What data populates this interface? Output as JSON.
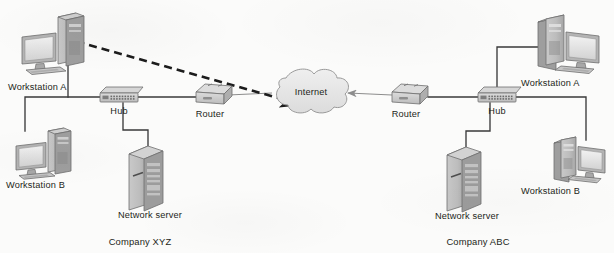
{
  "diagram": {
    "background_color": "#fbfbfa",
    "line_color": "#3a3a3a",
    "dashed_line_color": "#1c1c1c",
    "cloud_fill": "#e6e6e6",
    "cloud_stroke": "#9a9a9a",
    "device_fill": "#d9d9d9",
    "device_stroke": "#6e6e6e",
    "text_color": "#231f20"
  },
  "labels": {
    "internet": "Internet",
    "left_workstation_a": "Workstation A",
    "left_workstation_b": "Workstation B",
    "left_hub": "Hub",
    "left_router": "Router",
    "left_server": "Network server",
    "left_company": "Company XYZ",
    "right_workstation_a": "Workstation A",
    "right_workstation_b": "Workstation B",
    "right_hub": "Hub",
    "right_router": "Router",
    "right_server": "Network server",
    "right_company": "Company ABC"
  },
  "nodes": [
    {
      "id": "left-workstation-a",
      "type": "workstation",
      "label": "Workstation A",
      "side": "left"
    },
    {
      "id": "left-workstation-b",
      "type": "workstation",
      "label": "Workstation B",
      "side": "left"
    },
    {
      "id": "left-hub",
      "type": "hub",
      "label": "Hub",
      "side": "left"
    },
    {
      "id": "left-router",
      "type": "router",
      "label": "Router",
      "side": "left"
    },
    {
      "id": "left-server",
      "type": "server",
      "label": "Network server",
      "side": "left"
    },
    {
      "id": "internet-cloud",
      "type": "cloud",
      "label": "Internet",
      "side": "center"
    },
    {
      "id": "right-router",
      "type": "router",
      "label": "Router",
      "side": "right"
    },
    {
      "id": "right-hub",
      "type": "hub",
      "label": "Hub",
      "side": "right"
    },
    {
      "id": "right-workstation-a",
      "type": "workstation",
      "label": "Workstation A",
      "side": "right"
    },
    {
      "id": "right-workstation-b",
      "type": "workstation",
      "label": "Workstation B",
      "side": "right"
    },
    {
      "id": "right-server",
      "type": "server",
      "label": "Network server",
      "side": "right"
    }
  ],
  "connections": [
    {
      "from": "left-workstation-a",
      "to": "left-hub",
      "style": "solid"
    },
    {
      "from": "left-workstation-b",
      "to": "left-hub",
      "style": "solid"
    },
    {
      "from": "left-server",
      "to": "left-hub",
      "style": "solid"
    },
    {
      "from": "left-hub",
      "to": "left-router",
      "style": "solid"
    },
    {
      "from": "left-router",
      "to": "internet-cloud",
      "style": "solid"
    },
    {
      "from": "internet-cloud",
      "to": "right-router",
      "style": "arrow"
    },
    {
      "from": "right-router",
      "to": "right-hub",
      "style": "solid"
    },
    {
      "from": "right-hub",
      "to": "right-workstation-a",
      "style": "solid"
    },
    {
      "from": "right-hub",
      "to": "right-workstation-b",
      "style": "solid"
    },
    {
      "from": "right-hub",
      "to": "right-server",
      "style": "solid"
    },
    {
      "from": "left-workstation-a",
      "to": "internet-cloud",
      "style": "dashed-arrow"
    }
  ]
}
